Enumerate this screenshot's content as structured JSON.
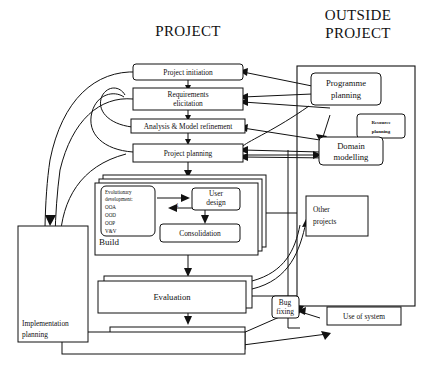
{
  "titles": {
    "left": "PROJECT",
    "right_line1": "OUTSIDE",
    "right_line2": "PROJECT"
  },
  "nodes": {
    "project_initiation": "Project initiation",
    "requirements_line1": "Requirements",
    "requirements_line2": "elicitation",
    "analysis": "Analysis & Model refinement",
    "project_planning": "Project planning",
    "programme_line1": "Programme",
    "programme_line2": "planning",
    "resource_line1": "Resource",
    "resource_line2": "planning",
    "domain_line1": "Domain",
    "domain_line2": "modelling",
    "other_line1": "Other",
    "other_line2": "projects",
    "build_label": "Build",
    "evo_line1": "Evolutionary",
    "evo_line2": "development:",
    "evo_item1": "OOA",
    "evo_item2": "OOD",
    "evo_item3": "OOP",
    "evo_item4": "V&V",
    "user_design_line1": "User",
    "user_design_line2": "design",
    "consolidation": "Consolidation",
    "evaluation": "Evaluation",
    "implementation_line1": "Implementation",
    "implementation_line2": "planning",
    "bug_line1": "Bug",
    "bug_line2": "fixing",
    "use_of_system": "Use of system",
    "loop_marker": "1"
  },
  "colors": {
    "stroke": "#111111",
    "fill": "#ffffff",
    "background": "#ffffff"
  }
}
